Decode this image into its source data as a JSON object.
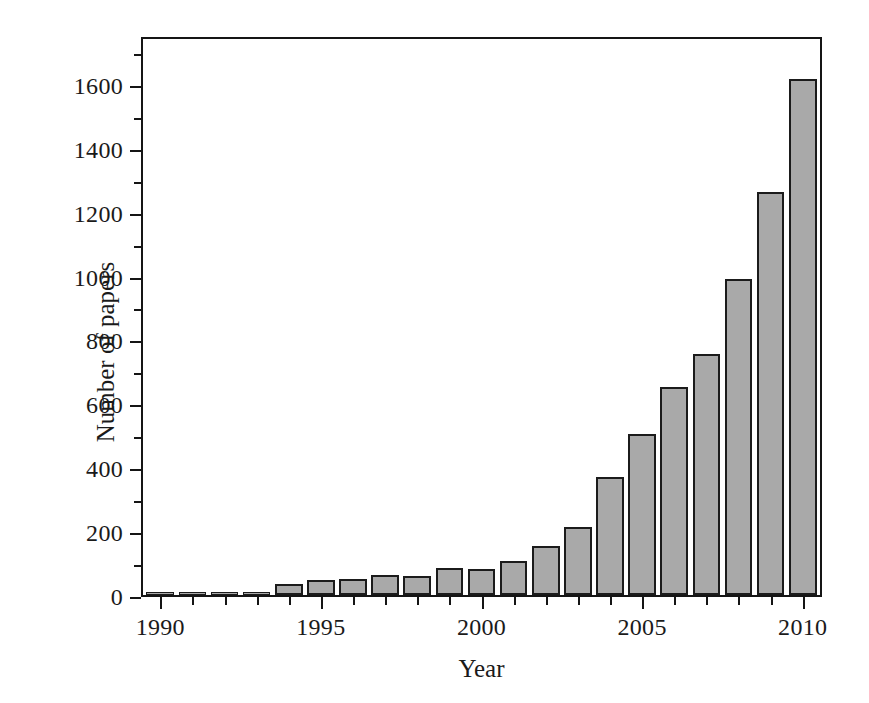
{
  "chart_data": {
    "type": "bar",
    "title": "",
    "xlabel": "Year",
    "ylabel": "Number of papers",
    "categories": [
      1990,
      1991,
      1992,
      1993,
      1994,
      1995,
      1996,
      1997,
      1998,
      1999,
      2000,
      2001,
      2002,
      2003,
      2004,
      2005,
      2006,
      2007,
      2008,
      2009,
      2010
    ],
    "values": [
      3,
      3,
      3,
      5,
      34,
      46,
      50,
      64,
      60,
      85,
      80,
      107,
      152,
      214,
      369,
      505,
      651,
      756,
      988,
      1263,
      1616
    ],
    "xlim": [
      1989.4,
      2010.6
    ],
    "ylim": [
      0,
      1753
    ],
    "x_major_ticks": [
      1990,
      1995,
      2000,
      2005,
      2010
    ],
    "x_minor_ticks": [
      1991,
      1992,
      1993,
      1994,
      1996,
      1997,
      1998,
      1999,
      2001,
      2002,
      2003,
      2004,
      2006,
      2007,
      2008,
      2009
    ],
    "x_tick_labels": [
      "1990",
      "1995",
      "2000",
      "2005",
      "2010"
    ],
    "y_major_ticks": [
      0,
      200,
      400,
      600,
      800,
      1000,
      1200,
      1400,
      1600
    ],
    "y_minor_ticks": [
      100,
      300,
      500,
      700,
      900,
      1100,
      1300,
      1500,
      1700
    ],
    "y_tick_labels": [
      "0",
      "200",
      "400",
      "600",
      "800",
      "1000",
      "1200",
      "1400",
      "1600"
    ],
    "grid": false,
    "legend": null,
    "bar_fill_color": "#a9a9a9",
    "bar_edge_color": "#1b1b1b",
    "axis_color": "#151515",
    "background_color": "#ffffff"
  }
}
